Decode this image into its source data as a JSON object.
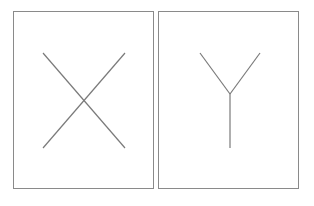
{
  "panels": [
    {
      "id": "left",
      "glyph": "X",
      "box": {
        "x": 13,
        "y": 11,
        "w": 141,
        "h": 178
      },
      "strokes": [
        {
          "x1": 29,
          "y1": 41,
          "x2": 111,
          "y2": 136
        },
        {
          "x1": 111,
          "y1": 41,
          "x2": 29,
          "y2": 136
        }
      ]
    },
    {
      "id": "right",
      "glyph": "Y",
      "box": {
        "x": 158,
        "y": 11,
        "w": 141,
        "h": 178
      },
      "strokes": [
        {
          "x1": 41,
          "y1": 41,
          "x2": 71,
          "y2": 82
        },
        {
          "x1": 101,
          "y1": 41,
          "x2": 71,
          "y2": 82
        },
        {
          "x1": 71,
          "y1": 82,
          "x2": 71,
          "y2": 136
        }
      ]
    }
  ],
  "colors": {
    "border": "#8a8a8a",
    "stroke": "#7a7a7a",
    "background": "#ffffff"
  }
}
